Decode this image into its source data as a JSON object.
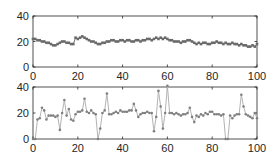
{
  "figure": {
    "width": 278,
    "height": 162,
    "background": "#ffffff",
    "axis_color": "#262626",
    "marker_color": "#808080",
    "line_color": "#b3b3b3"
  },
  "chart_data": [
    {
      "type": "line",
      "title": "",
      "xlabel": "",
      "ylabel": "",
      "xlim": [
        0,
        100
      ],
      "ylim": [
        0,
        40
      ],
      "xticks": [
        0,
        20,
        40,
        60,
        80,
        100
      ],
      "yticks": [
        0,
        20,
        40
      ],
      "grid": false,
      "legend": null,
      "marker": "square",
      "series": [
        {
          "name": "series1",
          "x": [
            0,
            1,
            2,
            3,
            4,
            5,
            6,
            7,
            8,
            9,
            10,
            11,
            12,
            13,
            14,
            15,
            16,
            17,
            18,
            19,
            20,
            21,
            22,
            23,
            24,
            25,
            26,
            27,
            28,
            29,
            30,
            31,
            32,
            33,
            34,
            35,
            36,
            37,
            38,
            39,
            40,
            41,
            42,
            43,
            44,
            45,
            46,
            47,
            48,
            49,
            50,
            51,
            52,
            53,
            54,
            55,
            56,
            57,
            58,
            59,
            60,
            61,
            62,
            63,
            64,
            65,
            66,
            67,
            68,
            69,
            70,
            71,
            72,
            73,
            74,
            75,
            76,
            77,
            78,
            79,
            80,
            81,
            82,
            83,
            84,
            85,
            86,
            87,
            88,
            89,
            90,
            91,
            92,
            93,
            94,
            95,
            96,
            97,
            98,
            99,
            100
          ],
          "values": [
            22,
            22,
            21,
            21,
            20,
            20,
            19,
            19,
            18,
            17,
            17,
            18,
            19,
            20,
            20,
            19,
            19,
            18,
            18,
            23,
            22,
            23,
            24,
            23,
            22,
            21,
            20,
            20,
            19,
            18,
            18,
            19,
            19,
            20,
            20,
            21,
            21,
            20,
            20,
            21,
            21,
            20,
            21,
            21,
            20,
            20,
            21,
            21,
            20,
            21,
            21,
            22,
            22,
            21,
            22,
            23,
            22,
            23,
            22,
            23,
            22,
            21,
            21,
            20,
            20,
            20,
            19,
            20,
            20,
            21,
            21,
            20,
            19,
            18,
            19,
            18,
            19,
            19,
            18,
            18,
            19,
            19,
            20,
            19,
            19,
            18,
            19,
            18,
            18,
            19,
            18,
            18,
            17,
            18,
            17,
            17,
            16,
            16,
            17,
            16,
            18
          ]
        }
      ]
    },
    {
      "type": "line",
      "title": "",
      "xlabel": "",
      "ylabel": "",
      "xlim": [
        0,
        100
      ],
      "ylim": [
        0,
        40
      ],
      "xticks": [
        0,
        20,
        40,
        60,
        80,
        100
      ],
      "yticks": [
        0,
        20,
        40
      ],
      "grid": false,
      "legend": null,
      "marker": "circle",
      "series": [
        {
          "name": "series2",
          "x": [
            0,
            1,
            2,
            3,
            4,
            5,
            6,
            7,
            8,
            9,
            10,
            11,
            12,
            13,
            14,
            15,
            16,
            17,
            18,
            19,
            20,
            21,
            22,
            23,
            24,
            25,
            26,
            27,
            28,
            29,
            30,
            31,
            32,
            33,
            34,
            35,
            36,
            37,
            38,
            39,
            40,
            41,
            42,
            43,
            44,
            45,
            46,
            47,
            48,
            49,
            50,
            51,
            52,
            53,
            54,
            55,
            56,
            57,
            58,
            59,
            60,
            61,
            62,
            63,
            64,
            65,
            66,
            67,
            68,
            69,
            70,
            71,
            72,
            73,
            74,
            75,
            76,
            77,
            78,
            79,
            80,
            81,
            82,
            83,
            84,
            85,
            86,
            87,
            88,
            89,
            90,
            91,
            92,
            93,
            94,
            95,
            96,
            97,
            98,
            99,
            100
          ],
          "values": [
            0,
            0,
            15,
            16,
            24,
            22,
            15,
            18,
            18,
            18,
            17,
            18,
            7,
            20,
            30,
            18,
            23,
            15,
            14,
            19,
            21,
            21,
            22,
            31,
            21,
            20,
            22,
            20,
            19,
            0,
            8,
            20,
            22,
            35,
            19,
            19,
            20,
            21,
            20,
            22,
            21,
            21,
            21,
            22,
            22,
            27,
            22,
            17,
            19,
            20,
            20,
            21,
            20,
            20,
            6,
            17,
            37,
            25,
            8,
            20,
            41,
            20,
            20,
            19,
            20,
            19,
            18,
            19,
            19,
            20,
            24,
            17,
            13,
            18,
            17,
            19,
            18,
            20,
            19,
            21,
            21,
            19,
            19,
            19,
            18,
            19,
            0,
            0,
            18,
            16,
            18,
            19,
            19,
            34,
            25,
            19,
            18,
            17,
            16,
            20,
            16
          ]
        }
      ]
    }
  ]
}
